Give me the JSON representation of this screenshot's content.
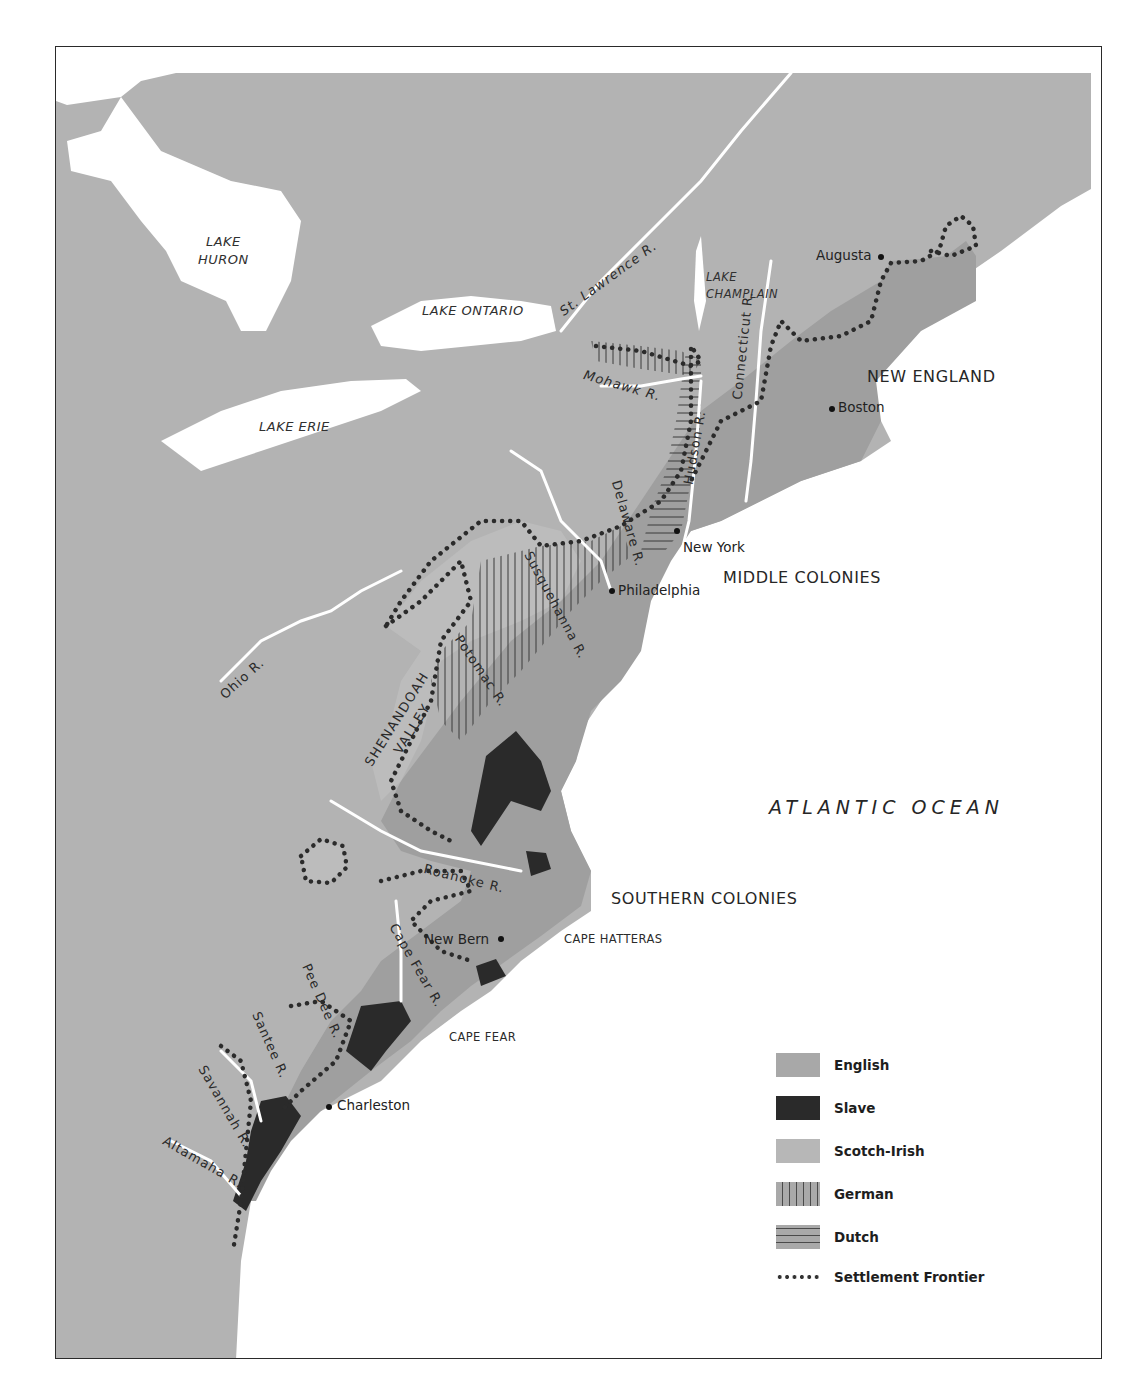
{
  "map": {
    "labels": {
      "lakes": {
        "huron": "LAKE\nHURON",
        "ontario": "LAKE ONTARIO",
        "erie": "LAKE ERIE",
        "champlain": "LAKE\nCHAMPLAIN"
      },
      "regions": {
        "new_england": "NEW ENGLAND",
        "middle_colonies": "MIDDLE COLONIES",
        "southern_colonies": "SOUTHERN COLONIES"
      },
      "ocean": "ATLANTIC OCEAN",
      "capes": {
        "hatteras": "CAPE HATTERAS",
        "fear": "CAPE FEAR"
      },
      "cities": {
        "augusta": "Augusta",
        "boston": "Boston",
        "new_york": "New York",
        "philadelphia": "Philadelphia",
        "new_bern": "New Bern",
        "charleston": "Charleston"
      },
      "rivers": {
        "st_lawrence": "St. Lawrence R.",
        "connecticut": "Connecticut R.",
        "mohawk": "Mohawk R.",
        "hudson": "Hudson R.",
        "delaware": "Delaware R.",
        "susquehanna": "Susquehanna R.",
        "potomac": "Potomac R.",
        "ohio": "Ohio R.",
        "roanoke": "Roanoke R.",
        "cape_fear": "Cape Fear R.",
        "pee_dee": "Pee Dee R.",
        "santee": "Santee R.",
        "savannah": "Savannah R.",
        "altamaha": "Altamaha R."
      },
      "valley": "SHENANDOAH\nVALLEY"
    },
    "legend": {
      "items": [
        {
          "key": "english",
          "label": "English"
        },
        {
          "key": "slave",
          "label": "Slave"
        },
        {
          "key": "scotch_irish",
          "label": "Scotch-Irish"
        },
        {
          "key": "german",
          "label": "German"
        },
        {
          "key": "dutch",
          "label": "Dutch"
        },
        {
          "key": "frontier",
          "label": "Settlement Frontier"
        }
      ]
    },
    "colors": {
      "land": "#b3b3b3",
      "english": "#a2a2a2",
      "slave": "#2a2a2a",
      "scotch_irish": "#bdbdbd",
      "water": "#ffffff",
      "frame": "#2a2a2a"
    }
  }
}
